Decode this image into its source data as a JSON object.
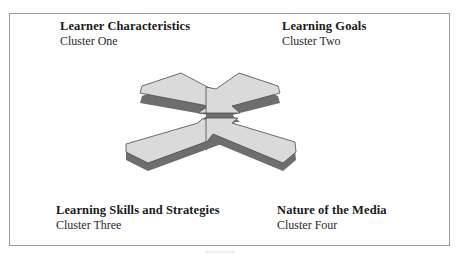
{
  "diagram": {
    "center_graphic": "four-converging-arrows",
    "colors": {
      "arrow_face": "#d9d9d9",
      "arrow_side": "#7a7a7a",
      "arrow_edge": "#4a4a4a",
      "frame_border": "#9a9a9a"
    },
    "clusters": [
      {
        "title": "Learner Characteristics",
        "subtitle": "Cluster One",
        "position": "top-left"
      },
      {
        "title": "Learning Goals",
        "subtitle": "Cluster Two",
        "position": "top-right"
      },
      {
        "title": "Learning Skills and Strategies",
        "subtitle": "Cluster Three",
        "position": "bottom-left"
      },
      {
        "title": "Nature of the Media",
        "subtitle": "Cluster Four",
        "position": "bottom-right"
      }
    ]
  }
}
